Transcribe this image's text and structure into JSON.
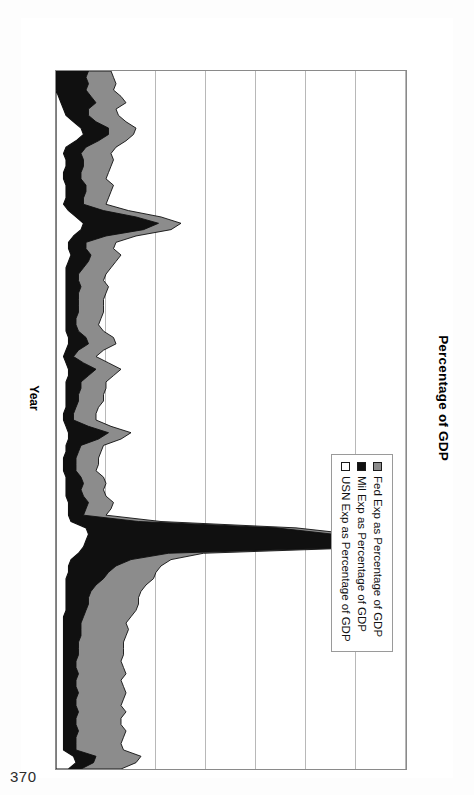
{
  "page": {
    "number": "370"
  },
  "chart_data": {
    "type": "area",
    "stacked": false,
    "title": "Percentage of GDP",
    "xlabel": "Year",
    "ylabel": "Percentage of GDP",
    "xlim": [
      1790,
      1900
    ],
    "ylim": [
      0,
      14
    ],
    "ytick_labels": [
      "0%",
      "2%",
      "4%",
      "6%",
      "8%",
      "10%",
      "12%",
      "14%"
    ],
    "ytick_values": [
      0,
      2,
      4,
      6,
      8,
      10,
      12,
      14
    ],
    "xtick_labels": [
      "1790",
      "1795",
      "1800",
      "1805",
      "1810",
      "1815",
      "1820",
      "1825",
      "1830",
      "1835",
      "1840",
      "1845",
      "1850",
      "1855",
      "1860",
      "1865",
      "1870",
      "1875",
      "1880",
      "1885",
      "1890",
      "1895",
      "1900"
    ],
    "xtick_values": [
      1790,
      1795,
      1800,
      1805,
      1810,
      1815,
      1820,
      1825,
      1830,
      1835,
      1840,
      1845,
      1850,
      1855,
      1860,
      1865,
      1870,
      1875,
      1880,
      1885,
      1890,
      1895,
      1900
    ],
    "grid": true,
    "legend_position": "upper right",
    "colors": {
      "fed": "#8c8c8c",
      "mil": "#101010",
      "usn": "#ffffff",
      "gridline": "#b8b8b8",
      "axis": "#8a8a8a"
    },
    "x": [
      1790,
      1791,
      1792,
      1793,
      1794,
      1795,
      1796,
      1797,
      1798,
      1799,
      1800,
      1801,
      1802,
      1803,
      1804,
      1805,
      1806,
      1807,
      1808,
      1809,
      1810,
      1811,
      1812,
      1813,
      1814,
      1815,
      1816,
      1817,
      1818,
      1819,
      1820,
      1821,
      1822,
      1823,
      1824,
      1825,
      1826,
      1827,
      1828,
      1829,
      1830,
      1831,
      1832,
      1833,
      1834,
      1835,
      1836,
      1837,
      1838,
      1839,
      1840,
      1841,
      1842,
      1843,
      1844,
      1845,
      1846,
      1847,
      1848,
      1849,
      1850,
      1851,
      1852,
      1853,
      1854,
      1855,
      1856,
      1857,
      1858,
      1859,
      1860,
      1861,
      1862,
      1863,
      1864,
      1865,
      1866,
      1867,
      1868,
      1869,
      1870,
      1871,
      1872,
      1873,
      1874,
      1875,
      1876,
      1877,
      1878,
      1879,
      1880,
      1881,
      1882,
      1883,
      1884,
      1885,
      1886,
      1887,
      1888,
      1889,
      1890,
      1891,
      1892,
      1893,
      1894,
      1895,
      1896,
      1897,
      1898,
      1899,
      1900
    ],
    "series": [
      {
        "name": "Fed Exp as Percentage of GDP",
        "key": "fed",
        "color": "#8c8c8c",
        "values": [
          2.2,
          2.3,
          2.4,
          2.3,
          2.6,
          2.8,
          2.4,
          2.5,
          2.8,
          3.2,
          3.1,
          2.8,
          2.4,
          2.2,
          2.3,
          2.2,
          2.1,
          2.0,
          2.3,
          2.2,
          2.1,
          2.0,
          2.9,
          4.2,
          5.0,
          4.6,
          3.2,
          2.4,
          2.3,
          2.6,
          2.4,
          2.2,
          2.0,
          1.9,
          2.1,
          2.0,
          1.9,
          1.9,
          1.9,
          1.8,
          1.7,
          1.9,
          2.3,
          2.4,
          1.9,
          1.6,
          2.1,
          2.6,
          2.3,
          2.0,
          2.0,
          1.9,
          1.9,
          1.7,
          1.6,
          1.6,
          2.2,
          3.0,
          2.6,
          1.9,
          1.8,
          1.7,
          1.7,
          1.6,
          1.9,
          2.0,
          1.9,
          2.0,
          2.3,
          2.2,
          2.0,
          4.2,
          9.6,
          11.9,
          12.6,
          13.2,
          5.9,
          4.6,
          4.2,
          4.0,
          3.9,
          3.6,
          3.4,
          3.3,
          3.3,
          3.2,
          3.0,
          2.8,
          2.9,
          2.8,
          2.7,
          2.7,
          2.7,
          2.6,
          2.7,
          2.8,
          2.6,
          2.7,
          2.8,
          2.7,
          2.6,
          2.8,
          2.6,
          2.6,
          2.8,
          2.7,
          2.6,
          2.7,
          3.4,
          3.2,
          2.6
        ]
      },
      {
        "name": "Mil Exp as Percentage of GDP",
        "key": "mil",
        "color": "#101010",
        "values": [
          1.3,
          1.2,
          1.3,
          1.2,
          1.4,
          1.6,
          1.3,
          1.3,
          1.6,
          2.1,
          2.1,
          1.7,
          1.2,
          1.0,
          1.1,
          1.1,
          1.0,
          1.0,
          1.2,
          1.2,
          1.1,
          1.1,
          1.9,
          3.2,
          4.1,
          3.5,
          2.0,
          1.2,
          1.2,
          1.4,
          1.3,
          1.1,
          0.9,
          0.9,
          1.0,
          0.9,
          0.9,
          0.9,
          0.9,
          0.8,
          0.8,
          0.9,
          1.2,
          1.3,
          0.9,
          0.7,
          1.1,
          1.6,
          1.3,
          1.0,
          1.0,
          0.9,
          0.9,
          0.8,
          0.7,
          0.7,
          1.3,
          2.1,
          1.7,
          1.0,
          0.9,
          0.8,
          0.8,
          0.8,
          1.0,
          1.1,
          1.0,
          1.1,
          1.3,
          1.2,
          1.1,
          3.3,
          8.8,
          11.1,
          11.8,
          12.5,
          4.5,
          3.0,
          2.4,
          2.1,
          1.9,
          1.6,
          1.4,
          1.3,
          1.3,
          1.2,
          1.1,
          1.0,
          1.0,
          1.0,
          0.9,
          0.9,
          0.9,
          0.8,
          0.8,
          0.9,
          0.8,
          0.8,
          0.9,
          0.8,
          0.8,
          0.9,
          0.8,
          0.8,
          0.9,
          0.8,
          0.8,
          0.8,
          1.6,
          1.5,
          1.0
        ]
      },
      {
        "name": "USN Exp as Percentage of GDP",
        "key": "usn",
        "color": "#ffffff",
        "values": [
          0.0,
          0.0,
          0.0,
          0.0,
          0.1,
          0.2,
          0.3,
          0.4,
          0.7,
          1.0,
          1.1,
          0.8,
          0.4,
          0.3,
          0.4,
          0.4,
          0.3,
          0.3,
          0.4,
          0.4,
          0.4,
          0.3,
          0.5,
          0.8,
          1.1,
          1.0,
          0.7,
          0.5,
          0.5,
          0.6,
          0.5,
          0.4,
          0.4,
          0.4,
          0.4,
          0.4,
          0.4,
          0.4,
          0.4,
          0.4,
          0.4,
          0.4,
          0.5,
          0.5,
          0.4,
          0.3,
          0.4,
          0.5,
          0.5,
          0.4,
          0.4,
          0.4,
          0.4,
          0.4,
          0.3,
          0.3,
          0.4,
          0.5,
          0.5,
          0.4,
          0.4,
          0.3,
          0.3,
          0.3,
          0.4,
          0.4,
          0.4,
          0.4,
          0.5,
          0.5,
          0.5,
          0.6,
          1.2,
          1.3,
          1.2,
          1.1,
          0.9,
          0.6,
          0.5,
          0.5,
          0.4,
          0.4,
          0.4,
          0.4,
          0.4,
          0.4,
          0.3,
          0.3,
          0.3,
          0.3,
          0.3,
          0.3,
          0.3,
          0.3,
          0.3,
          0.3,
          0.3,
          0.3,
          0.3,
          0.3,
          0.3,
          0.3,
          0.3,
          0.3,
          0.3,
          0.3,
          0.3,
          0.3,
          0.7,
          0.8,
          0.5
        ]
      }
    ]
  }
}
